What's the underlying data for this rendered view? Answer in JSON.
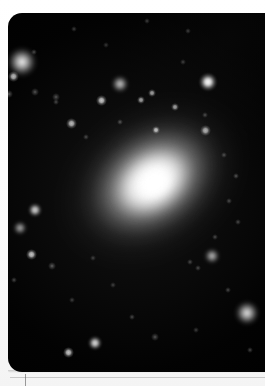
{
  "image": {
    "title": "Elliptical galaxy",
    "kind": "astronomical-photograph",
    "frame": {
      "x": 8,
      "y": 13,
      "width": 257,
      "height": 359,
      "corner_radius": 14
    },
    "background_color": "#000000",
    "border_color": "#fdfdfd",
    "alt": "Grayscale astronomical image of a bright elliptical galaxy with a saturated core, surrounded by a smooth halo, field stars and faint background galaxies on a black sky."
  },
  "galaxy": {
    "name": "central-elliptical-galaxy",
    "center_x": 153,
    "center_y": 182,
    "rotation_deg": -35,
    "core_color": "#ffffff",
    "layers": [
      {
        "name": "halo-outer",
        "cx": 152,
        "cy": 181,
        "rx": 108,
        "ry": 80
      },
      {
        "name": "halo-mid",
        "cx": 152,
        "cy": 181,
        "rx": 76,
        "ry": 55
      },
      {
        "name": "bulge",
        "cx": 153,
        "cy": 182,
        "rx": 44,
        "ry": 32
      },
      {
        "name": "core",
        "cx": 155,
        "cy": 183,
        "rx": 19,
        "ry": 15
      }
    ]
  },
  "sources": [
    {
      "name": "companion-galaxy-upper-left",
      "type": "fuzzy",
      "x": 22,
      "y": 62,
      "size": 17,
      "brightness": 0.95
    },
    {
      "name": "star-upper-left-a",
      "type": "star",
      "x": 13,
      "y": 76,
      "size": 5,
      "brightness": 0.7
    },
    {
      "name": "star-upper-left-b",
      "type": "faint",
      "x": 9,
      "y": 94,
      "size": 4,
      "brightness": 0.5
    },
    {
      "name": "star-upper-left-c",
      "type": "faint",
      "x": 35,
      "y": 92,
      "size": 4,
      "brightness": 0.45
    },
    {
      "name": "star-field-a",
      "type": "faint",
      "x": 56,
      "y": 97,
      "size": 4,
      "brightness": 0.45
    },
    {
      "name": "star-field-b",
      "type": "faint",
      "x": 56,
      "y": 102,
      "size": 3,
      "brightness": 0.4
    },
    {
      "name": "star-upper-mid",
      "type": "faint",
      "x": 34,
      "y": 52,
      "size": 3,
      "brightness": 0.4
    },
    {
      "name": "star-upper-right-faint",
      "type": "faint",
      "x": 147,
      "y": 21,
      "size": 3,
      "brightness": 0.35
    },
    {
      "name": "star-top-right-faint",
      "type": "faint",
      "x": 188,
      "y": 31,
      "size": 3,
      "brightness": 0.35
    },
    {
      "name": "bright-star-right",
      "type": "star",
      "x": 208,
      "y": 82,
      "size": 8,
      "brightness": 1.0
    },
    {
      "name": "star-right-faint-a",
      "type": "faint",
      "x": 183,
      "y": 62,
      "size": 3,
      "brightness": 0.35
    },
    {
      "name": "star-right-faint-b",
      "type": "faint",
      "x": 205,
      "y": 115,
      "size": 3,
      "brightness": 0.4
    },
    {
      "name": "companion-galaxy-top",
      "type": "fuzzy",
      "x": 120,
      "y": 84,
      "size": 10,
      "brightness": 0.8
    },
    {
      "name": "globular-cluster-a",
      "type": "star",
      "x": 101,
      "y": 100,
      "size": 5,
      "brightness": 0.75
    },
    {
      "name": "globular-cluster-b",
      "type": "star",
      "x": 141,
      "y": 100,
      "size": 4,
      "brightness": 0.6
    },
    {
      "name": "globular-cluster-c",
      "type": "star",
      "x": 152,
      "y": 93,
      "size": 4,
      "brightness": 0.6
    },
    {
      "name": "globular-cluster-d",
      "type": "star",
      "x": 175,
      "y": 107,
      "size": 4,
      "brightness": 0.6
    },
    {
      "name": "globular-cluster-e",
      "type": "star",
      "x": 156,
      "y": 130,
      "size": 4,
      "brightness": 0.7
    },
    {
      "name": "globular-cluster-f",
      "type": "faint",
      "x": 120,
      "y": 122,
      "size": 3,
      "brightness": 0.45
    },
    {
      "name": "globular-cluster-g",
      "type": "star",
      "x": 71,
      "y": 123,
      "size": 5,
      "brightness": 0.7
    },
    {
      "name": "globular-cluster-h",
      "type": "faint",
      "x": 86,
      "y": 137,
      "size": 3,
      "brightness": 0.4
    },
    {
      "name": "globular-cluster-i",
      "type": "star",
      "x": 205,
      "y": 130,
      "size": 5,
      "brightness": 0.65
    },
    {
      "name": "globular-cluster-j",
      "type": "faint",
      "x": 224,
      "y": 155,
      "size": 3,
      "brightness": 0.4
    },
    {
      "name": "globular-cluster-k",
      "type": "faint",
      "x": 236,
      "y": 176,
      "size": 3,
      "brightness": 0.45
    },
    {
      "name": "globular-cluster-l",
      "type": "faint",
      "x": 229,
      "y": 201,
      "size": 3,
      "brightness": 0.4
    },
    {
      "name": "globular-cluster-m",
      "type": "faint",
      "x": 238,
      "y": 222,
      "size": 3,
      "brightness": 0.4
    },
    {
      "name": "globular-cluster-n",
      "type": "faint",
      "x": 215,
      "y": 237,
      "size": 3,
      "brightness": 0.4
    },
    {
      "name": "star-left-mid",
      "type": "star",
      "x": 35,
      "y": 210,
      "size": 6,
      "brightness": 0.8
    },
    {
      "name": "edge-on-galaxy-left",
      "type": "fuzzy",
      "x": 20,
      "y": 228,
      "size": 8,
      "brightness": 0.7
    },
    {
      "name": "star-left-lower-a",
      "type": "star",
      "x": 31,
      "y": 254,
      "size": 5,
      "brightness": 0.75
    },
    {
      "name": "star-left-lower-b",
      "type": "faint",
      "x": 52,
      "y": 266,
      "size": 4,
      "brightness": 0.5
    },
    {
      "name": "star-left-lower-c",
      "type": "faint",
      "x": 14,
      "y": 280,
      "size": 3,
      "brightness": 0.4
    },
    {
      "name": "star-bottom-a",
      "type": "star",
      "x": 95,
      "y": 343,
      "size": 6,
      "brightness": 0.85
    },
    {
      "name": "star-bottom-b",
      "type": "star",
      "x": 68,
      "y": 352,
      "size": 5,
      "brightness": 0.75
    },
    {
      "name": "star-bottom-c",
      "type": "faint",
      "x": 155,
      "y": 337,
      "size": 4,
      "brightness": 0.45
    },
    {
      "name": "star-bottom-d",
      "type": "faint",
      "x": 132,
      "y": 317,
      "size": 3,
      "brightness": 0.4
    },
    {
      "name": "companion-galaxy-lower-right",
      "type": "fuzzy",
      "x": 247,
      "y": 313,
      "size": 14,
      "brightness": 0.9
    },
    {
      "name": "companion-galaxy-lower-mid",
      "type": "fuzzy",
      "x": 212,
      "y": 256,
      "size": 9,
      "brightness": 0.75
    },
    {
      "name": "star-lower-right-a",
      "type": "faint",
      "x": 228,
      "y": 290,
      "size": 3,
      "brightness": 0.4
    },
    {
      "name": "star-lower-right-b",
      "type": "faint",
      "x": 250,
      "y": 350,
      "size": 3,
      "brightness": 0.4
    },
    {
      "name": "star-lower-right-c",
      "type": "faint",
      "x": 196,
      "y": 330,
      "size": 3,
      "brightness": 0.35
    },
    {
      "name": "galaxy-group-knot-a",
      "type": "faint",
      "x": 190,
      "y": 262,
      "size": 3,
      "brightness": 0.4
    },
    {
      "name": "galaxy-group-knot-b",
      "type": "faint",
      "x": 198,
      "y": 268,
      "size": 3,
      "brightness": 0.4
    },
    {
      "name": "star-mid-field-a",
      "type": "faint",
      "x": 93,
      "y": 258,
      "size": 3,
      "brightness": 0.35
    },
    {
      "name": "star-mid-field-b",
      "type": "faint",
      "x": 113,
      "y": 285,
      "size": 3,
      "brightness": 0.35
    },
    {
      "name": "star-mid-field-c",
      "type": "faint",
      "x": 72,
      "y": 300,
      "size": 3,
      "brightness": 0.35
    },
    {
      "name": "star-top-edge-a",
      "type": "faint",
      "x": 74,
      "y": 29,
      "size": 3,
      "brightness": 0.35
    },
    {
      "name": "star-top-edge-b",
      "type": "faint",
      "x": 106,
      "y": 45,
      "size": 3,
      "brightness": 0.3
    }
  ],
  "print_marks": {
    "bottom_rule_label": "bottom-rule",
    "tick_label": "registration-tick"
  }
}
